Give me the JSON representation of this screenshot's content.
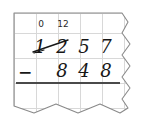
{
  "worksheet": {
    "type": "handwritten-subtraction-regrouping",
    "operation_symbol": "−",
    "minuend_digits": [
      "1",
      "2",
      "5",
      "7"
    ],
    "subtrahend_digits": [
      "8",
      "4",
      "8"
    ],
    "regroup_marks": [
      {
        "label": "0",
        "over_column": 0
      },
      {
        "label": "12",
        "over_column": 1
      }
    ],
    "crossed_out_digits": [
      "1",
      "2"
    ],
    "answer_digits": [
      "",
      "",
      "",
      ""
    ],
    "paper": {
      "background_color": "#ffffff",
      "grid_line_color": "#d8d8d8",
      "edge_color": "#8a8a8a",
      "ink_color": "#171717",
      "rule_color": "#4a4a4a"
    }
  }
}
